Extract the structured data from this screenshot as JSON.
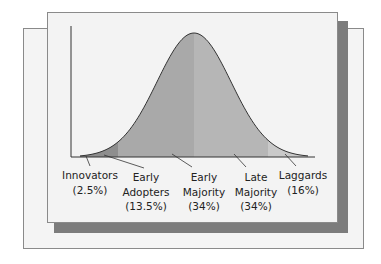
{
  "chart_data": {
    "type": "area",
    "title": "",
    "xlabel": "",
    "ylabel": "",
    "categories": [
      "Innovators",
      "Early Adopters",
      "Early Majority",
      "Late Majority",
      "Laggards"
    ],
    "values": [
      2.5,
      13.5,
      34,
      34,
      16
    ],
    "unit": "%",
    "labels": [
      {
        "lines": [
          "Innovators",
          "(2.5%)"
        ]
      },
      {
        "lines": [
          "Early",
          "Adopters",
          "(13.5%)"
        ]
      },
      {
        "lines": [
          "Early",
          "Majority",
          "(34%)"
        ]
      },
      {
        "lines": [
          "Late",
          "Majority",
          "(34%)"
        ]
      },
      {
        "lines": [
          "Laggards",
          "(16%)"
        ]
      }
    ],
    "colors": {
      "innovators": "#8e8e8e",
      "early_adopters": "#9c9c9c",
      "early_majority": "#a9a9a9",
      "late_majority": "#b6b6b6",
      "laggards": "#c9c9c9",
      "shadow": "#7c7c7c",
      "card": "#f3f3f3"
    }
  }
}
